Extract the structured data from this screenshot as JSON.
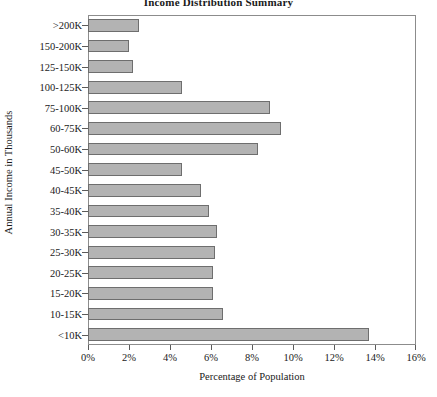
{
  "chart_data": {
    "type": "bar",
    "orientation": "horizontal",
    "title": "Income Distribution Summary",
    "xlabel": "Percentage of Population",
    "ylabel": "Annual Income in Thousands",
    "xlim": [
      0,
      16
    ],
    "xticks": [
      0,
      2,
      4,
      6,
      8,
      10,
      12,
      14,
      16
    ],
    "xtick_labels": [
      "0%",
      "2%",
      "4%",
      "6%",
      "8%",
      "10%",
      "12%",
      "14%",
      "16%"
    ],
    "grid": false,
    "legend": null,
    "bar_color": "#b3b3b3",
    "bar_edge_color": "#6e6e6e",
    "categories": [
      ">200K",
      "150-200K",
      "125-150K",
      "100-125K",
      "75-100K",
      "60-75K",
      "50-60K",
      "45-50K",
      "40-45K",
      "35-40K",
      "30-35K",
      "25-30K",
      "20-25K",
      "15-20K",
      "10-15K",
      "<10K"
    ],
    "values": [
      2.5,
      2.0,
      2.2,
      4.6,
      8.9,
      9.4,
      8.3,
      4.6,
      5.5,
      5.9,
      6.3,
      6.2,
      6.1,
      6.1,
      6.6,
      13.7
    ]
  }
}
